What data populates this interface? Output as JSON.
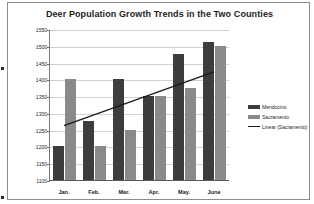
{
  "chart_data": {
    "type": "bar",
    "title": "Deer Population Growth Trends in the Two Counties",
    "xlabel": "",
    "ylabel": "",
    "categories": [
      "Jan.",
      "Feb.",
      "Mar.",
      "Apr.",
      "May.",
      "June"
    ],
    "series": [
      {
        "name": "Mendocino",
        "type": "bar",
        "color": "#3d3d3d",
        "values": [
          1200,
          1275,
          1400,
          1350,
          1475,
          1510
        ]
      },
      {
        "name": "Sacramento",
        "type": "bar",
        "color": "#8a8a8a",
        "values": [
          1400,
          1200,
          1250,
          1350,
          1375,
          1500
        ]
      },
      {
        "name": "Linear (Sacramento)",
        "type": "line",
        "color": "#1a1a1a",
        "values": [
          1265,
          1297,
          1329,
          1361,
          1393,
          1425
        ]
      }
    ],
    "ylim": [
      1100,
      1550
    ],
    "yticks": [
      1100,
      1150,
      1200,
      1250,
      1300,
      1350,
      1400,
      1450,
      1500,
      1550
    ],
    "ytick_labels": [
      "1100",
      "1150",
      "1200",
      "1250",
      "1300",
      "1350",
      "1400",
      "1450",
      "1500",
      "1550"
    ],
    "grid": true,
    "legend_position": "right",
    "legend": [
      "Mendocino",
      "Sacramento",
      "Linear (Sacramento)"
    ]
  }
}
